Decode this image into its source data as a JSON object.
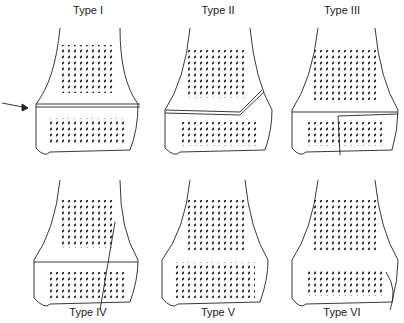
{
  "labels": [
    "Type I",
    "Type II",
    "Type III",
    "Type IV",
    "Type V",
    "Type VI"
  ]
}
